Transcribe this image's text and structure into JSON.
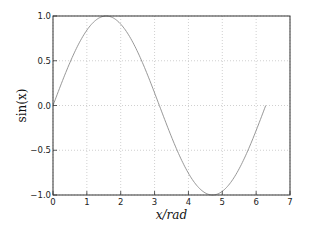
{
  "chart_data": {
    "type": "line",
    "title": "",
    "xlabel": "x/rad",
    "ylabel": "sin(x)",
    "xlim": [
      0,
      7
    ],
    "ylim": [
      -1.0,
      1.0
    ],
    "grid": true,
    "xticks": [
      "0",
      "1",
      "2",
      "3",
      "4",
      "5",
      "6",
      "7"
    ],
    "yticks": [
      "-1.0",
      "-0.5",
      "0.0",
      "0.5",
      "1.0"
    ],
    "series": [
      {
        "name": "sin(x)",
        "function": "sin",
        "x_range": [
          0,
          6.2832
        ],
        "color": "#8c8c8c"
      }
    ]
  }
}
